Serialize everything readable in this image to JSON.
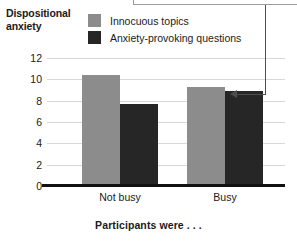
{
  "chart_data": {
    "type": "bar",
    "title": "",
    "xlabel": "Participants were . . .",
    "ylabel": "Dispositional anxiety",
    "categories": [
      "Not busy",
      "Busy"
    ],
    "series": [
      {
        "name": "Innocuous topics",
        "color": "#8c8c8c",
        "values": [
          10.4,
          9.3
        ]
      },
      {
        "name": "Anxiety-provoking questions",
        "color": "#262626",
        "values": [
          7.7,
          8.9
        ]
      }
    ],
    "ylim": [
      0,
      12
    ],
    "yticks": [
      0,
      2,
      4,
      6,
      8,
      10,
      12
    ],
    "ytick_labels": [
      "0",
      "2",
      "4",
      "6",
      "8",
      "10",
      "12"
    ],
    "grid": true,
    "legend_position": "top-center"
  },
  "annotation": {
    "callout_text": "",
    "points_to": "Anxiety-provoking questions bar in Busy group"
  },
  "axis": {
    "y_title_line1": "Dispositional",
    "y_title_line2": "anxiety"
  }
}
